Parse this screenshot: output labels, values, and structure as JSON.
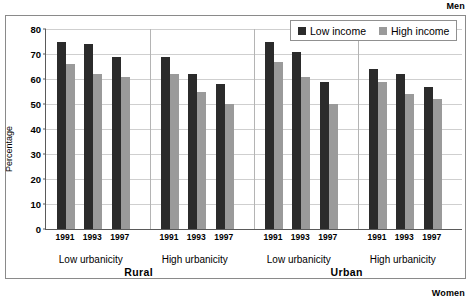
{
  "captions": {
    "top_right": "Men",
    "bottom_right": "Women"
  },
  "legend": {
    "items": [
      {
        "label": "Low income",
        "color": "#2b2b2b",
        "key": "low"
      },
      {
        "label": "High income",
        "color": "#9a9a9a",
        "key": "high"
      }
    ]
  },
  "axis": {
    "y_title": "Percentage",
    "y_ticks": [
      "0",
      "10",
      "20",
      "30",
      "40",
      "50",
      "60",
      "70",
      "80"
    ]
  },
  "group_labels": {
    "major": [
      "Rural",
      "Urban"
    ],
    "sub": [
      "Low urbanicity",
      "High urbanicity",
      "Low urbanicity",
      "High urbanicity"
    ]
  },
  "chart_data": {
    "type": "bar",
    "title": "",
    "subtitle": "",
    "xlabel": "",
    "ylabel": "Percentage",
    "ylim": [
      0,
      80
    ],
    "ytick_step": 10,
    "grid": true,
    "legend_position": "top-right",
    "annotations": [
      "Men",
      "Women"
    ],
    "categories": [
      "Rural / Low urbanicity / 1991",
      "Rural / Low urbanicity / 1993",
      "Rural / Low urbanicity / 1997",
      "Rural / High urbanicity / 1991",
      "Rural / High urbanicity / 1993",
      "Rural / High urbanicity / 1997",
      "Urban / Low urbanicity / 1991",
      "Urban / Low urbanicity / 1993",
      "Urban / Low urbanicity / 1997",
      "Urban / High urbanicity / 1991",
      "Urban / High urbanicity / 1993",
      "Urban / High urbanicity / 1997"
    ],
    "tick_labels": [
      "1991",
      "1993",
      "1997",
      "1991",
      "1993",
      "1997",
      "1991",
      "1993",
      "1997",
      "1991",
      "1993",
      "1997"
    ],
    "series": [
      {
        "name": "Low income",
        "color": "#2b2b2b",
        "values": [
          75,
          74,
          69,
          69,
          62,
          58,
          75,
          71,
          59,
          64,
          62,
          57
        ]
      },
      {
        "name": "High income",
        "color": "#9a9a9a",
        "values": [
          66,
          62,
          61,
          62,
          55,
          50,
          67,
          61,
          50,
          59,
          54,
          52
        ]
      }
    ],
    "groups": [
      {
        "major": "Rural",
        "sub": "Low urbanicity",
        "years": [
          "1991",
          "1993",
          "1997"
        ],
        "low": [
          75,
          74,
          69
        ],
        "high": [
          66,
          62,
          61
        ]
      },
      {
        "major": "Rural",
        "sub": "High urbanicity",
        "years": [
          "1991",
          "1993",
          "1997"
        ],
        "low": [
          69,
          62,
          58
        ],
        "high": [
          62,
          55,
          50
        ]
      },
      {
        "major": "Urban",
        "sub": "Low urbanicity",
        "years": [
          "1991",
          "1993",
          "1997"
        ],
        "low": [
          75,
          71,
          59
        ],
        "high": [
          67,
          61,
          50
        ]
      },
      {
        "major": "Urban",
        "sub": "High urbanicity",
        "years": [
          "1991",
          "1993",
          "1997"
        ],
        "low": [
          64,
          62,
          57
        ],
        "high": [
          59,
          54,
          52
        ]
      }
    ]
  }
}
